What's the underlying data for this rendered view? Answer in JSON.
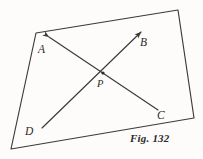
{
  "figure": {
    "caption": "Fig. 132",
    "background_color": "#fdfcfa",
    "ink_color": "#3a3a3a",
    "labels": {
      "A": "A",
      "B": "B",
      "C": "C",
      "D": "D",
      "P": "P"
    },
    "quadrilateral": {
      "name": "enclosing-quadrilateral",
      "points": "36,33 178,10 194,118 11,149"
    },
    "lines": [
      {
        "name": "ray-A-to-C",
        "from_label": "A",
        "to_label": "C",
        "x1": 49,
        "y1": 37,
        "x2": 158,
        "y2": 110,
        "arrow_at": "start"
      },
      {
        "name": "ray-D-to-B",
        "from_label": "D",
        "to_label": "B",
        "x1": 42,
        "y1": 128,
        "x2": 141,
        "y2": 32,
        "arrow_at": "end"
      }
    ],
    "intersection_point": {
      "name": "P",
      "x": 103,
      "y": 73
    }
  }
}
